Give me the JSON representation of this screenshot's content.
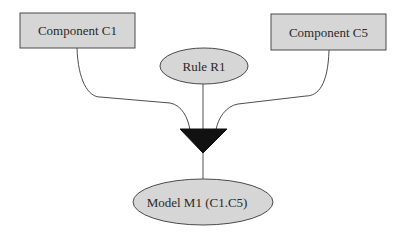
{
  "diagram": {
    "nodes": {
      "component_c1": {
        "label": "Component C1",
        "shape": "rectangle",
        "fill": "#d6d6d6"
      },
      "component_c5": {
        "label": "Component C5",
        "shape": "rectangle",
        "fill": "#d6d6d6"
      },
      "rule_r1": {
        "label": "Rule R1",
        "shape": "ellipse",
        "fill": "#d6d6d6"
      },
      "merge_junction": {
        "shape": "inverted-triangle",
        "fill": "#111111"
      },
      "model_m1": {
        "label": "Model M1 (C1.C5)",
        "shape": "ellipse",
        "fill": "#d6d6d6"
      }
    },
    "edges": [
      {
        "from": "component_c1",
        "to": "merge_junction"
      },
      {
        "from": "component_c5",
        "to": "merge_junction"
      },
      {
        "from": "rule_r1",
        "to": "merge_junction"
      },
      {
        "from": "merge_junction",
        "to": "model_m1"
      }
    ],
    "colors": {
      "stroke": "#3a3a3a",
      "node_fill": "#d6d6d6",
      "junction": "#111111"
    }
  }
}
